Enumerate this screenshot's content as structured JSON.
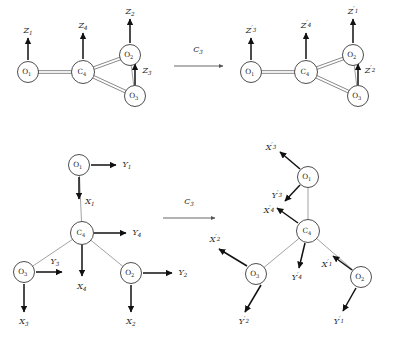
{
  "figure": {
    "background": "#ffffff",
    "ink_color": "#222222",
    "bond_color": "#6b6b6b",
    "vector_color": "#111111"
  },
  "operation": {
    "symbol": "C",
    "subscript": "3",
    "top_label": "C₃",
    "bottom_label": "C₃"
  },
  "panels": [
    {
      "id": "top-left",
      "name": "z-vectors-before",
      "atoms": [
        {
          "id": "a1",
          "symbol": "O",
          "sub": "1",
          "cx": 28,
          "cy": 72,
          "r": 10.5
        },
        {
          "id": "a4",
          "symbol": "C",
          "sub": "4",
          "cx": 83,
          "cy": 72,
          "r": 11.5
        },
        {
          "id": "a2",
          "symbol": "O",
          "sub": "2",
          "cx": 130,
          "cy": 55,
          "r": 10.5
        },
        {
          "id": "a3",
          "symbol": "O",
          "sub": "3",
          "cx": 135,
          "cy": 96,
          "r": 10.5
        }
      ],
      "bonds": [
        {
          "from": "a1",
          "to": "a4",
          "order": 2
        },
        {
          "from": "a4",
          "to": "a2",
          "order": 2
        },
        {
          "from": "a4",
          "to": "a3",
          "order": 2
        },
        {
          "from": "a2",
          "to": "a3",
          "order": 1
        }
      ],
      "vectors": [
        {
          "label": "Z",
          "sub": "1",
          "prime": false,
          "x1": 28,
          "y1": 60,
          "x2": 28,
          "y2": 38,
          "lx": 28,
          "ly": 31
        },
        {
          "label": "Z",
          "sub": "4",
          "prime": false,
          "x1": 83,
          "y1": 59,
          "x2": 83,
          "y2": 33,
          "lx": 83,
          "ly": 26
        },
        {
          "label": "Z",
          "sub": "2",
          "prime": false,
          "x1": 130,
          "y1": 43,
          "x2": 130,
          "y2": 19,
          "lx": 130,
          "ly": 12
        },
        {
          "label": "Z",
          "sub": "3",
          "prime": false,
          "x1": 135,
          "y1": 85,
          "x2": 135,
          "y2": 64,
          "lx": 147,
          "ly": 71
        }
      ]
    },
    {
      "id": "top-right",
      "name": "z-vectors-after",
      "atoms": [
        {
          "id": "b1",
          "symbol": "O",
          "sub": "1",
          "cx": 251,
          "cy": 72,
          "r": 10.5
        },
        {
          "id": "b4",
          "symbol": "C",
          "sub": "4",
          "cx": 306,
          "cy": 72,
          "r": 11.5
        },
        {
          "id": "b2",
          "symbol": "O",
          "sub": "2",
          "cx": 353,
          "cy": 55,
          "r": 10.5
        },
        {
          "id": "b3",
          "symbol": "O",
          "sub": "3",
          "cx": 358,
          "cy": 96,
          "r": 10.5
        }
      ],
      "bonds": [
        {
          "from": "b1",
          "to": "b4",
          "order": 2
        },
        {
          "from": "b4",
          "to": "b2",
          "order": 2
        },
        {
          "from": "b4",
          "to": "b3",
          "order": 2
        },
        {
          "from": "b2",
          "to": "b3",
          "order": 1
        }
      ],
      "vectors": [
        {
          "label": "Z",
          "sub": "3",
          "prime": true,
          "x1": 251,
          "y1": 60,
          "x2": 251,
          "y2": 38,
          "lx": 251,
          "ly": 31
        },
        {
          "label": "Z",
          "sub": "4",
          "prime": true,
          "x1": 306,
          "y1": 59,
          "x2": 306,
          "y2": 33,
          "lx": 306,
          "ly": 26
        },
        {
          "label": "Z",
          "sub": "1",
          "prime": true,
          "x1": 353,
          "y1": 43,
          "x2": 353,
          "y2": 19,
          "lx": 353,
          "ly": 12
        },
        {
          "label": "Z",
          "sub": "2",
          "prime": true,
          "x1": 358,
          "y1": 85,
          "x2": 358,
          "y2": 64,
          "lx": 370,
          "ly": 71
        }
      ]
    },
    {
      "id": "bottom-left",
      "name": "xy-vectors-before",
      "atoms": [
        {
          "id": "c1",
          "symbol": "O",
          "sub": "1",
          "cx": 79,
          "cy": 165,
          "r": 10.5
        },
        {
          "id": "c4",
          "symbol": "C",
          "sub": "4",
          "cx": 82,
          "cy": 233,
          "r": 11.5
        },
        {
          "id": "c3",
          "symbol": "O",
          "sub": "3",
          "cx": 24,
          "cy": 272,
          "r": 10.5
        },
        {
          "id": "c2",
          "symbol": "O",
          "sub": "2",
          "cx": 131,
          "cy": 273,
          "r": 10.5
        }
      ],
      "bonds": [
        {
          "from": "c1",
          "to": "c4",
          "order": 1
        },
        {
          "from": "c4",
          "to": "c3",
          "order": 1
        },
        {
          "from": "c4",
          "to": "c2",
          "order": 1
        }
      ],
      "vectors": [
        {
          "label": "Y",
          "sub": "1",
          "prime": false,
          "x1": 91,
          "y1": 165,
          "x2": 116,
          "y2": 165,
          "lx": 127,
          "ly": 165
        },
        {
          "label": "X",
          "sub": "1",
          "prime": false,
          "x1": 79,
          "y1": 177,
          "x2": 79,
          "y2": 199,
          "lx": 90,
          "ly": 202
        },
        {
          "label": "Y",
          "sub": "4",
          "prime": false,
          "x1": 94,
          "y1": 233,
          "x2": 126,
          "y2": 233,
          "lx": 137,
          "ly": 233
        },
        {
          "label": "X",
          "sub": "4",
          "prime": false,
          "x1": 82,
          "y1": 245,
          "x2": 82,
          "y2": 276,
          "lx": 82,
          "ly": 287
        },
        {
          "label": "Y",
          "sub": "3",
          "prime": false,
          "x1": 36,
          "y1": 272,
          "x2": 62,
          "y2": 272,
          "lx": 55,
          "ly": 262
        },
        {
          "label": "X",
          "sub": "3",
          "prime": false,
          "x1": 24,
          "y1": 284,
          "x2": 24,
          "y2": 312,
          "lx": 24,
          "ly": 322
        },
        {
          "label": "Y",
          "sub": "2",
          "prime": false,
          "x1": 143,
          "y1": 273,
          "x2": 172,
          "y2": 273,
          "lx": 183,
          "ly": 273
        },
        {
          "label": "X",
          "sub": "2",
          "prime": false,
          "x1": 131,
          "y1": 285,
          "x2": 131,
          "y2": 312,
          "lx": 131,
          "ly": 322
        }
      ]
    },
    {
      "id": "bottom-right",
      "name": "xy-vectors-after",
      "atoms": [
        {
          "id": "d1",
          "symbol": "O",
          "sub": "1",
          "cx": 308,
          "cy": 177,
          "r": 10.5
        },
        {
          "id": "d4",
          "symbol": "C",
          "sub": "4",
          "cx": 308,
          "cy": 231,
          "r": 11.5
        },
        {
          "id": "d3",
          "symbol": "O",
          "sub": "3",
          "cx": 256,
          "cy": 274,
          "r": 10.5
        },
        {
          "id": "d2",
          "symbol": "O",
          "sub": "2",
          "cx": 361,
          "cy": 277,
          "r": 10.5
        }
      ],
      "bonds": [
        {
          "from": "d1",
          "to": "d4",
          "order": 1
        },
        {
          "from": "d4",
          "to": "d3",
          "order": 1
        },
        {
          "from": "d4",
          "to": "d2",
          "order": 1
        }
      ],
      "vectors": [
        {
          "label": "X",
          "sub": "3",
          "prime": true,
          "x1": 300,
          "y1": 169,
          "x2": 280,
          "y2": 152,
          "lx": 271,
          "ly": 148
        },
        {
          "label": "Y",
          "sub": "3",
          "prime": true,
          "x1": 300,
          "y1": 185,
          "x2": 285,
          "y2": 201,
          "lx": 277,
          "ly": 196
        },
        {
          "label": "X",
          "sub": "4",
          "prime": true,
          "x1": 298,
          "y1": 223,
          "x2": 277,
          "y2": 208,
          "lx": 269,
          "ly": 211
        },
        {
          "label": "Y",
          "sub": "4",
          "prime": true,
          "x1": 305,
          "y1": 243,
          "x2": 299,
          "y2": 268,
          "lx": 297,
          "ly": 278
        },
        {
          "label": "X",
          "sub": "2",
          "prime": true,
          "x1": 247,
          "y1": 266,
          "x2": 219,
          "y2": 249,
          "lx": 215,
          "ly": 240
        },
        {
          "label": "Y",
          "sub": "2",
          "prime": true,
          "x1": 261,
          "y1": 285,
          "x2": 245,
          "y2": 312,
          "lx": 244,
          "ly": 322
        },
        {
          "label": "X",
          "sub": "1",
          "prime": true,
          "x1": 352,
          "y1": 270,
          "x2": 333,
          "y2": 256,
          "lx": 327,
          "ly": 265
        },
        {
          "label": "Y",
          "sub": "1",
          "prime": true,
          "x1": 356,
          "y1": 288,
          "x2": 343,
          "y2": 311,
          "lx": 339,
          "ly": 322
        }
      ]
    }
  ],
  "op_arrows": [
    {
      "id": "top-op",
      "name": "c3-arrow-top",
      "x1": 174,
      "y1": 66,
      "x2": 223,
      "y2": 66,
      "lx": 198,
      "ly": 50
    },
    {
      "id": "bottom-op",
      "name": "c3-arrow-bottom",
      "x1": 163,
      "y1": 218,
      "x2": 215,
      "y2": 218,
      "lx": 189,
      "ly": 202
    }
  ]
}
